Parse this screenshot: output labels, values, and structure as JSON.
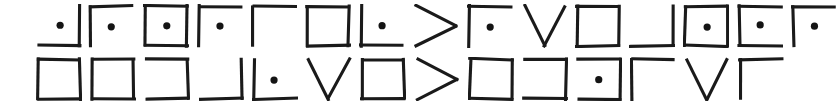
{
  "canvas": {
    "width": 839,
    "height": 107,
    "background_color": "#ffffff",
    "ink_color": "#1a1a1a",
    "description": "Two rows of hand-drawn geometric box-like glyphs"
  },
  "rows": [
    {
      "name": "row-1",
      "top": 0,
      "glyph_count": 15,
      "glyphs": [
        {
          "name": "bottom-right-corner-dot",
          "strokes": [
            "bottom",
            "right"
          ],
          "dot": true,
          "label": "_|•",
          "x": 36,
          "w": 46,
          "h": 44,
          "top": 4
        },
        {
          "name": "top-left-corner-dot",
          "strokes": [
            "top",
            "left"
          ],
          "dot": true,
          "label": "Γ•",
          "x": 88,
          "w": 46,
          "h": 44,
          "top": 4
        },
        {
          "name": "square-dot",
          "strokes": [
            "top",
            "right",
            "bottom",
            "left"
          ],
          "dot": true,
          "label": "□•",
          "x": 143,
          "w": 46,
          "h": 44,
          "top": 4
        },
        {
          "name": "top-left-corner-dot",
          "strokes": [
            "top",
            "left"
          ],
          "dot": true,
          "label": "Γ•",
          "x": 197,
          "w": 46,
          "h": 44,
          "top": 4
        },
        {
          "name": "top-left-corner",
          "strokes": [
            "top",
            "left"
          ],
          "dot": false,
          "label": "Γ",
          "x": 251,
          "w": 46,
          "h": 44,
          "top": 4
        },
        {
          "name": "square",
          "strokes": [
            "top",
            "right",
            "bottom",
            "left"
          ],
          "dot": false,
          "label": "□",
          "x": 305,
          "w": 46,
          "h": 44,
          "top": 4
        },
        {
          "name": "bottom-left-corner-dot",
          "strokes": [
            "left",
            "bottom"
          ],
          "dot": true,
          "label": "L•",
          "x": 359,
          "w": 46,
          "h": 44,
          "top": 4
        },
        {
          "name": "chevron-right",
          "strokes": [
            "chevron-right"
          ],
          "dot": false,
          "label": ">",
          "x": 413,
          "w": 46,
          "h": 44,
          "top": 4
        },
        {
          "name": "top-left-corner-dot",
          "strokes": [
            "top",
            "left"
          ],
          "dot": true,
          "label": "Γ•",
          "x": 467,
          "w": 46,
          "h": 44,
          "top": 4
        },
        {
          "name": "vee",
          "strokes": [
            "vee"
          ],
          "dot": false,
          "label": "V",
          "x": 521,
          "w": 46,
          "h": 44,
          "top": 4
        },
        {
          "name": "square",
          "strokes": [
            "top",
            "right",
            "bottom",
            "left"
          ],
          "dot": false,
          "label": "□",
          "x": 575,
          "w": 46,
          "h": 44,
          "top": 4
        },
        {
          "name": "bottom-right-corner",
          "strokes": [
            "bottom",
            "right"
          ],
          "dot": false,
          "label": "_|",
          "x": 629,
          "w": 46,
          "h": 44,
          "top": 4
        },
        {
          "name": "square-dot",
          "strokes": [
            "top",
            "right",
            "bottom",
            "left"
          ],
          "dot": true,
          "label": "□•",
          "x": 683,
          "w": 46,
          "h": 44,
          "top": 4
        },
        {
          "name": "bracket-left-dot",
          "strokes": [
            "top",
            "left",
            "bottom"
          ],
          "dot": true,
          "label": "⊏•",
          "x": 737,
          "w": 46,
          "h": 44,
          "top": 4
        },
        {
          "name": "top-left-corner-dot",
          "strokes": [
            "top",
            "left"
          ],
          "dot": true,
          "label": "Γ•",
          "x": 791,
          "w": 46,
          "h": 44,
          "top": 4
        }
      ]
    },
    {
      "name": "row-2",
      "top": 53,
      "glyph_count": 14,
      "glyphs": [
        {
          "name": "square",
          "strokes": [
            "top",
            "right",
            "bottom",
            "left"
          ],
          "dot": false,
          "label": "□",
          "x": 36,
          "w": 46,
          "h": 44,
          "top": 4
        },
        {
          "name": "square",
          "strokes": [
            "top",
            "right",
            "bottom",
            "left"
          ],
          "dot": false,
          "label": "□",
          "x": 90,
          "w": 46,
          "h": 44,
          "top": 4
        },
        {
          "name": "bracket-right",
          "strokes": [
            "top",
            "right",
            "bottom"
          ],
          "dot": false,
          "label": "⊐",
          "x": 144,
          "w": 46,
          "h": 44,
          "top": 4
        },
        {
          "name": "bottom-right-corner",
          "strokes": [
            "bottom",
            "right"
          ],
          "dot": false,
          "label": "_|",
          "x": 198,
          "w": 46,
          "h": 44,
          "top": 4
        },
        {
          "name": "bottom-left-corner-dot",
          "strokes": [
            "left",
            "bottom"
          ],
          "dot": true,
          "label": "L•",
          "x": 252,
          "w": 46,
          "h": 44,
          "top": 4
        },
        {
          "name": "vee",
          "strokes": [
            "vee"
          ],
          "dot": false,
          "label": "V",
          "x": 306,
          "w": 46,
          "h": 44,
          "top": 4
        },
        {
          "name": "square",
          "strokes": [
            "top",
            "right",
            "bottom",
            "left"
          ],
          "dot": false,
          "label": "□",
          "x": 360,
          "w": 46,
          "h": 44,
          "top": 4
        },
        {
          "name": "chevron-right",
          "strokes": [
            "chevron-right"
          ],
          "dot": false,
          "label": ">",
          "x": 414,
          "w": 46,
          "h": 44,
          "top": 4
        },
        {
          "name": "square",
          "strokes": [
            "top",
            "right",
            "bottom",
            "left"
          ],
          "dot": false,
          "label": "□",
          "x": 468,
          "w": 46,
          "h": 44,
          "top": 4
        },
        {
          "name": "bracket-right",
          "strokes": [
            "top",
            "right",
            "bottom"
          ],
          "dot": false,
          "label": "⊐",
          "x": 522,
          "w": 46,
          "h": 44,
          "top": 4
        },
        {
          "name": "bracket-right-dot",
          "strokes": [
            "top",
            "right",
            "bottom"
          ],
          "dot": true,
          "label": "⊐•",
          "x": 576,
          "w": 46,
          "h": 44,
          "top": 4
        },
        {
          "name": "top-left-corner",
          "strokes": [
            "top",
            "left"
          ],
          "dot": false,
          "label": "Γ",
          "x": 630,
          "w": 46,
          "h": 44,
          "top": 4
        },
        {
          "name": "vee",
          "strokes": [
            "vee"
          ],
          "dot": false,
          "label": "V",
          "x": 684,
          "w": 46,
          "h": 44,
          "top": 4
        },
        {
          "name": "top-left-corner",
          "strokes": [
            "top",
            "left"
          ],
          "dot": false,
          "label": "Γ",
          "x": 738,
          "w": 46,
          "h": 44,
          "top": 4
        }
      ]
    }
  ]
}
